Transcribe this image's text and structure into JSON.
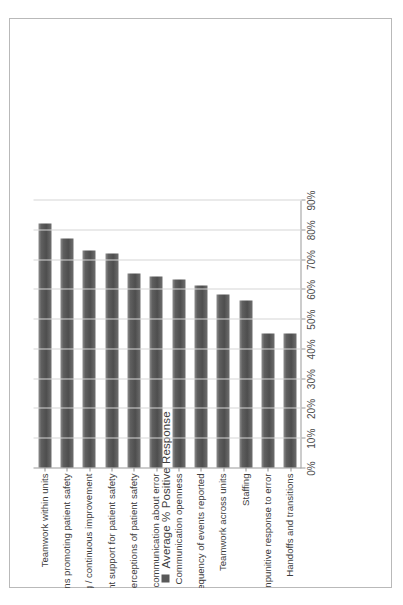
{
  "figure": {
    "frame_color": "#b9b9b9",
    "background": "#ffffff",
    "orientation": "rotated-90-ccw"
  },
  "legend": {
    "label": "Average % Positive Response",
    "swatch_color": "#595959",
    "marker_icon": "square-swatch-icon"
  },
  "axis": {
    "tick_labels": [
      "0%",
      "10%",
      "20%",
      "30%",
      "40%",
      "50%",
      "60%",
      "70%",
      "80%",
      "90%"
    ],
    "min": 0,
    "max": 90
  },
  "chart_data": {
    "type": "bar",
    "title": "",
    "subtitle": "",
    "xlabel": "",
    "ylabel": "",
    "orientation": "horizontal",
    "grid": true,
    "legend_position": "top-left",
    "xlim": [
      0,
      90
    ],
    "categories": [
      "Teamwork within units",
      "Supervisor / Manager expectations and actions promoting patient safety",
      "Organizational learning / continuous improvement",
      "Management support for patient safety",
      "Overall perceptions of patient safety",
      "Feedback and communication about error",
      "Communication openness",
      "Frequency of events reported",
      "Teamwork across units",
      "Staffing",
      "Nonpunitive response to error",
      "Handoffs and transitions"
    ],
    "series": [
      {
        "name": "Average % Positive Response",
        "values": [
          82,
          77,
          73,
          72,
          65,
          64,
          63,
          61,
          58,
          56,
          45,
          45
        ]
      }
    ]
  }
}
